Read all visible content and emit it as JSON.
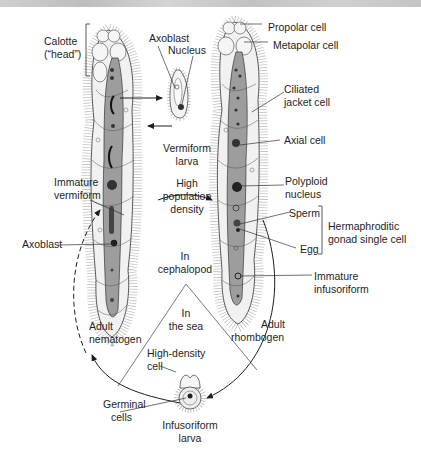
{
  "figure": {
    "type": "life-cycle diagram"
  },
  "labels": {
    "calotte": [
      "Calotte",
      "(“head”)"
    ],
    "axoblast_top": "Axoblast",
    "nucleus": "Nucleus",
    "propolar": "Propolar cell",
    "metapolar": "Metapolar cell",
    "ciliated_jacket": [
      "Ciliated",
      "jacket cell"
    ],
    "axial_cell": "Axial cell",
    "vermiform_larva": [
      "Vermiform",
      "larva"
    ],
    "high_population": [
      "High",
      "population",
      "density"
    ],
    "polyploid": [
      "Polyploid",
      "nucleus"
    ],
    "immature_vermiform": [
      "Immature",
      "vermiform"
    ],
    "sperm": "Sperm",
    "egg": "Egg",
    "hermaphroditic": [
      "Hermaphroditic",
      "gonad single cell"
    ],
    "axoblast_left": "Axoblast",
    "in_cephalopod": [
      "In",
      "cephalopod"
    ],
    "immature_infusoriform": [
      "Immature",
      "infusoriform"
    ],
    "in_the_sea": [
      "In",
      "the sea"
    ],
    "adult_nematogen": [
      "Adult",
      "nematogen"
    ],
    "adult_rhombogen": [
      "Adult",
      "rhombogen"
    ],
    "high_density_cell": [
      "High-density",
      "cell"
    ],
    "germinal_cells": [
      "Germinal",
      "cells"
    ],
    "infusoriform_larva": [
      "Infusoriform",
      "larva"
    ]
  },
  "colors": {
    "ink": "#1e1e1e",
    "axial_fill": "#9a9a9a",
    "jacket_fill": "#efefef",
    "cilia": "#9c9c9c",
    "banner": "#c8c8c8"
  }
}
